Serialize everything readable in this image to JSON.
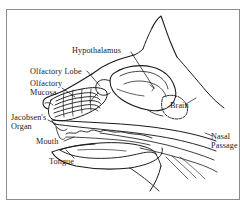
{
  "figure": {
    "style": "black-line-drawing-on-white",
    "frame": {
      "present": true,
      "color": "#8c8c8c",
      "background": "#ffffff"
    },
    "ink_color": "#1a1a1a"
  },
  "labels": {
    "hypothalamus": "Hypothalamus",
    "olfactory_lobe": "Olfactory Lobe",
    "olfactory_mucosa_line1": "Olfactory",
    "olfactory_mucosa_line2": "Mucosa",
    "jacobsens_organ_line1": "Jacobsen's",
    "jacobsens_organ_line2": "Organ",
    "mouth": "Mouth",
    "tongue": "Tongue",
    "brain": "Brain",
    "nasal_passage_line1": "Nasal",
    "nasal_passage_line2": "Passage"
  },
  "structures": [
    "ear",
    "skull-outline",
    "brain",
    "hypothalamus",
    "olfactory-lobe",
    "olfactory-mucosa-turbinates",
    "jacobsens-organ",
    "nasal-passage",
    "mouth-palate",
    "tongue",
    "lower-jaw",
    "throat"
  ]
}
